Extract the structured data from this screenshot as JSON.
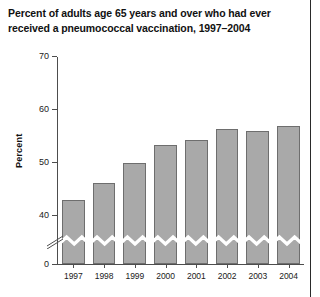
{
  "chart_data": {
    "type": "bar",
    "title": "Percent of adults age 65 years and over who had ever received a pneumococcal vaccination, 1997–2004",
    "title_lines": [
      "Percent of adults age 65 years and over who had ever",
      "received a pneumococcal vaccination, 1997–2004"
    ],
    "xlabel": "",
    "ylabel": "Percent",
    "categories": [
      "1997",
      "1998",
      "1999",
      "2000",
      "2001",
      "2002",
      "2003",
      "2004"
    ],
    "values": [
      42.8,
      46.0,
      49.8,
      53.2,
      54.2,
      56.3,
      55.9,
      56.8
    ],
    "ylim": [
      0,
      70
    ],
    "yticks": [
      0,
      40,
      50,
      60,
      70
    ],
    "ytick_labels": [
      "0",
      "40",
      "50",
      "60",
      "70"
    ],
    "grid": false,
    "legend": null,
    "axis_break": true,
    "axis_break_note": "y-axis broken between 0 and 40",
    "series": [
      {
        "name": "Percent vaccinated",
        "values": [
          42.8,
          46.0,
          49.8,
          53.2,
          54.2,
          56.3,
          55.9,
          56.8
        ]
      }
    ],
    "colors": {
      "bar_fill": "#a9a9a9",
      "bar_border": "#6e6e6e",
      "axis": "#4d4d4d",
      "text": "#111111",
      "background": "#ffffff"
    }
  }
}
